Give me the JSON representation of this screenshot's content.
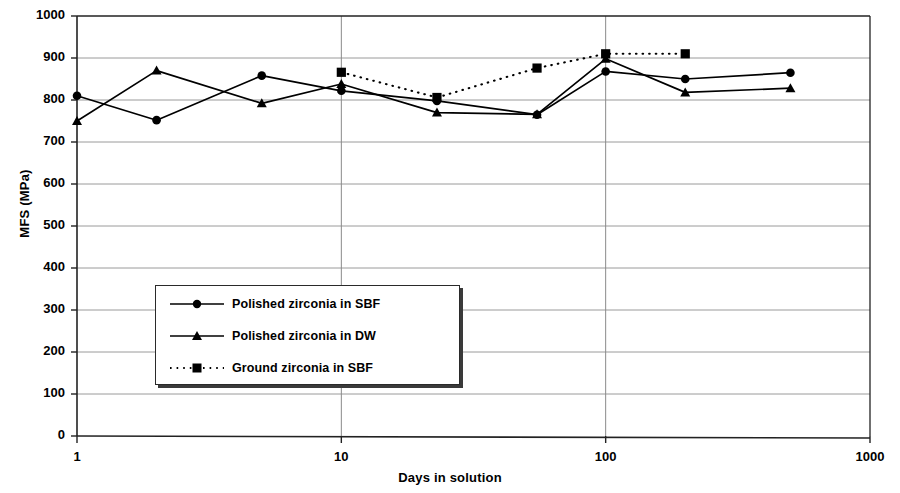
{
  "chart_data": {
    "type": "line",
    "title": "",
    "xlabel": "Days in solution",
    "ylabel": "MFS (MPa)",
    "xscale": "log",
    "xlim": [
      1,
      1000
    ],
    "ylim": [
      0,
      1000
    ],
    "xticks": [
      1,
      10,
      100,
      1000
    ],
    "xtick_labels": [
      "1",
      "10",
      "100",
      "1000"
    ],
    "yticks": [
      0,
      100,
      200,
      300,
      400,
      500,
      600,
      700,
      800,
      900,
      1000
    ],
    "ytick_labels": [
      "0",
      "100",
      "200",
      "300",
      "400",
      "500",
      "600",
      "700",
      "800",
      "900",
      "1000"
    ],
    "grid": "horizontal-and-vertical-major",
    "legend_position": "inside-lower-left",
    "series": [
      {
        "name": "Polished zirconia in SBF",
        "marker": "circle",
        "line": "solid",
        "color": "#000000",
        "x": [
          1,
          2,
          5,
          10,
          23,
          55,
          100,
          200,
          500
        ],
        "y": [
          810,
          752,
          858,
          822,
          798,
          765,
          868,
          850,
          865
        ]
      },
      {
        "name": "Polished zirconia in DW",
        "marker": "triangle",
        "line": "solid",
        "color": "#000000",
        "x": [
          1,
          2,
          5,
          10,
          23,
          55,
          100,
          200,
          500
        ],
        "y": [
          750,
          870,
          792,
          838,
          770,
          766,
          898,
          818,
          828
        ]
      },
      {
        "name": "Ground zirconia in SBF",
        "marker": "square",
        "line": "dotted",
        "color": "#000000",
        "x": [
          10,
          23,
          55,
          100,
          200
        ],
        "y": [
          866,
          806,
          876,
          910,
          910
        ]
      }
    ]
  },
  "legend": {
    "entries": [
      {
        "label": "Polished zirconia in SBF"
      },
      {
        "label": "Polished zirconia in DW"
      },
      {
        "label": "Ground zirconia in SBF"
      }
    ]
  },
  "axes": {
    "x_title": "Days in solution",
    "y_title": "MFS (MPa)"
  }
}
